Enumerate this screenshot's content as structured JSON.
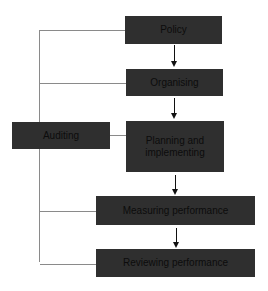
{
  "diagram": {
    "title": "",
    "nodes": [
      {
        "id": "policy",
        "label": "Policy"
      },
      {
        "id": "organising",
        "label": "Organising"
      },
      {
        "id": "planning",
        "label": "Planning and implementing"
      },
      {
        "id": "measuring",
        "label": "Measuring performance"
      },
      {
        "id": "reviewing",
        "label": "Reviewing performance"
      },
      {
        "id": "auditing",
        "label": "Auditing"
      }
    ],
    "edges": [
      {
        "from": "policy",
        "to": "organising",
        "type": "arrow"
      },
      {
        "from": "organising",
        "to": "planning",
        "type": "arrow"
      },
      {
        "from": "planning",
        "to": "measuring",
        "type": "arrow"
      },
      {
        "from": "measuring",
        "to": "reviewing",
        "type": "arrow"
      },
      {
        "from": "auditing",
        "to": "policy",
        "type": "line"
      },
      {
        "from": "auditing",
        "to": "organising",
        "type": "line"
      },
      {
        "from": "auditing",
        "to": "planning",
        "type": "line"
      },
      {
        "from": "auditing",
        "to": "measuring",
        "type": "line"
      },
      {
        "from": "auditing",
        "to": "reviewing",
        "type": "line"
      }
    ],
    "colors": {
      "box": "#2f2f2f",
      "text": "#0c0c0c",
      "connector": "#8a8a8a",
      "arrow": "#111111"
    }
  }
}
